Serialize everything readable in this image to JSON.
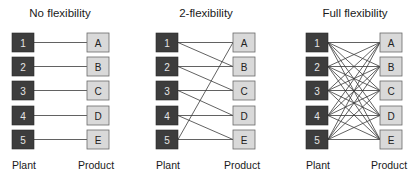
{
  "plants": [
    "1",
    "2",
    "3",
    "4",
    "5"
  ],
  "products": [
    "A",
    "B",
    "C",
    "D",
    "E"
  ],
  "labels": {
    "plant": "Plant",
    "product": "Product"
  },
  "colors": {
    "plant_fill": "#3d3d3d",
    "product_fill": "#d9d9d9",
    "line": "#3a3a3a"
  },
  "panels": [
    {
      "title": "No flexibility",
      "links": [
        [
          0,
          0
        ],
        [
          1,
          1
        ],
        [
          2,
          2
        ],
        [
          3,
          3
        ],
        [
          4,
          4
        ]
      ]
    },
    {
      "title": "2-flexibility",
      "links": [
        [
          0,
          0
        ],
        [
          0,
          1
        ],
        [
          1,
          1
        ],
        [
          1,
          2
        ],
        [
          2,
          2
        ],
        [
          2,
          3
        ],
        [
          3,
          3
        ],
        [
          3,
          4
        ],
        [
          4,
          4
        ],
        [
          4,
          0
        ]
      ]
    },
    {
      "title": "Full flexibility",
      "links": "all"
    }
  ]
}
